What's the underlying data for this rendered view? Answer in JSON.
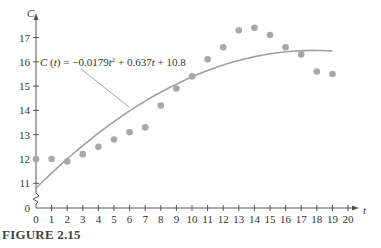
{
  "figure_label": "FIGURE 2.15",
  "chart_data": {
    "type": "scatter",
    "title": "",
    "xlabel": "t",
    "ylabel": "C",
    "x_ticks": [
      0,
      1,
      2,
      3,
      4,
      5,
      6,
      7,
      8,
      9,
      10,
      11,
      12,
      13,
      14,
      15,
      16,
      17,
      18,
      19,
      20
    ],
    "y_ticks": [
      0,
      11,
      12,
      13,
      14,
      15,
      16,
      17
    ],
    "y_axis_break": true,
    "xlim": [
      0,
      20
    ],
    "ylim": [
      10,
      17.5
    ],
    "series": [
      {
        "name": "data",
        "kind": "scatter",
        "color": "#a8a8a8",
        "x": [
          0,
          1,
          2,
          3,
          4,
          5,
          6,
          7,
          8,
          9,
          10,
          11,
          12,
          13,
          14,
          15,
          16,
          17,
          18,
          19
        ],
        "y": [
          12.0,
          12.0,
          11.9,
          12.2,
          12.5,
          12.8,
          13.1,
          13.3,
          14.2,
          14.9,
          15.4,
          16.1,
          16.6,
          17.3,
          17.4,
          17.1,
          16.6,
          16.3,
          15.6,
          15.5
        ]
      },
      {
        "name": "C(t) = -0.0179t² + 0.637t + 10.8",
        "kind": "line",
        "color": "#a0a0a0",
        "coefficients": {
          "a": -0.0179,
          "b": 0.637,
          "c": 10.8
        },
        "x_range": [
          0,
          19
        ]
      }
    ],
    "annotations": [
      {
        "text": "C (t) = −0.0179t² + 0.637t + 10.8",
        "points_to": "fitted curve"
      }
    ],
    "grid": false,
    "legend": "none"
  },
  "labels": {
    "equation_prefix": "C (t) = −0.0179",
    "equation_t1": "t",
    "equation_sup": "2",
    "equation_mid": " + 0.637",
    "equation_t2": "t",
    "equation_end": " + 10.8"
  }
}
